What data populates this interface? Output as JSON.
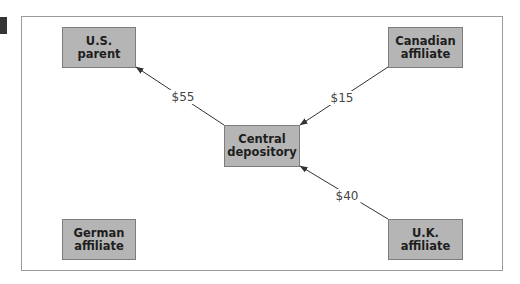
{
  "diagram": {
    "nodes": [
      {
        "id": "us_parent",
        "label": "U.S.\nparent"
      },
      {
        "id": "canadian_affiliate",
        "label": "Canadian\naffiliate"
      },
      {
        "id": "central_depository",
        "label": "Central\ndepository"
      },
      {
        "id": "german_affiliate",
        "label": "German\naffiliate"
      },
      {
        "id": "uk_affiliate",
        "label": "U.K.\naffiliate"
      }
    ],
    "edges": [
      {
        "from": "central_depository",
        "to": "us_parent",
        "label": "$55"
      },
      {
        "from": "canadian_affiliate",
        "to": "central_depository",
        "label": "$15"
      },
      {
        "from": "uk_affiliate",
        "to": "central_depository",
        "label": "$40"
      }
    ]
  },
  "colors": {
    "node_fill": "#b5b5b5",
    "node_border": "#7c7c7c",
    "frame_border": "#9a9a9a",
    "arrow": "#333333",
    "marker": "#353535"
  }
}
